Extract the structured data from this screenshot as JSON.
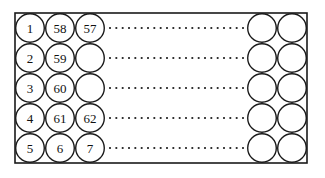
{
  "figure": {
    "frame": {
      "x": 15,
      "y": 13,
      "width": 292,
      "height": 150,
      "stroke_color": "#1a1a1a"
    },
    "circle": {
      "diameter": 30,
      "radius": 15,
      "fill_color": "#ffffff",
      "stroke_color": "#1a1a1a"
    },
    "left_group": {
      "columns": 3,
      "rows": 5,
      "start_x": 15,
      "start_y": 13,
      "labels": [
        [
          "1",
          "58",
          "57"
        ],
        [
          "2",
          "59",
          ""
        ],
        [
          "3",
          "60",
          ""
        ],
        [
          "4",
          "61",
          "62"
        ],
        [
          "5",
          "6",
          "7"
        ]
      ]
    },
    "right_group": {
      "columns": 2,
      "rows": 5,
      "start_x": 247,
      "start_y": 13,
      "labels": [
        [
          "",
          ""
        ],
        [
          "",
          ""
        ],
        [
          "",
          ""
        ],
        [
          "",
          ""
        ],
        [
          "",
          ""
        ]
      ]
    },
    "ellipsis": {
      "rows": 5,
      "dots_per_row": 22,
      "start_x": 110,
      "end_x": 243,
      "dot_size": 1.8,
      "dot_color": "#1a1a1a",
      "row_centers": [
        28,
        58,
        88,
        118,
        148
      ]
    }
  }
}
